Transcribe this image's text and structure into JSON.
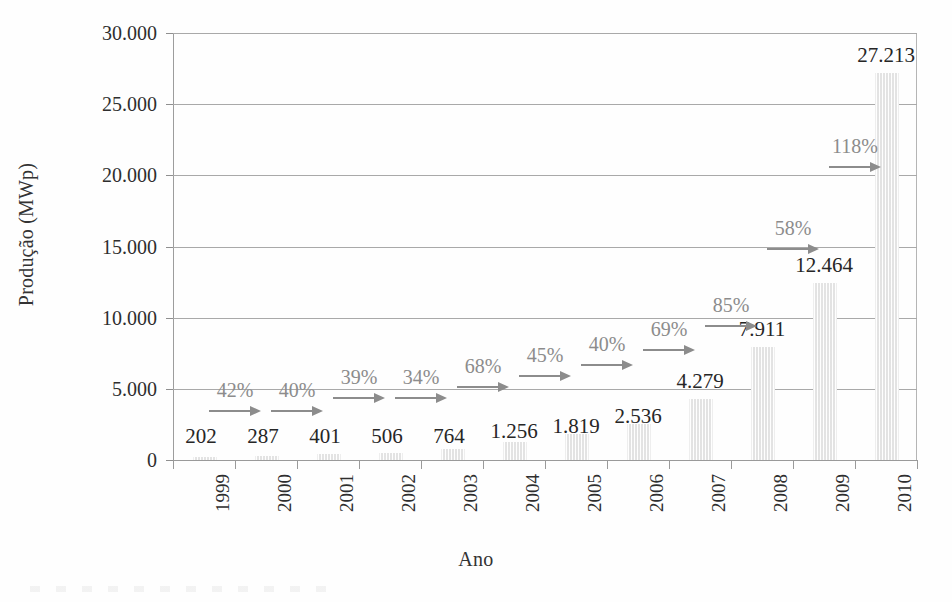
{
  "chart_data": {
    "type": "bar",
    "title": "",
    "xlabel": "Ano",
    "ylabel": "Produção (MWp)",
    "categories": [
      "1999",
      "2000",
      "2001",
      "2002",
      "2003",
      "2004",
      "2005",
      "2006",
      "2007",
      "2008",
      "2009",
      "2010"
    ],
    "values": [
      202,
      287,
      401,
      506,
      764,
      1256,
      1819,
      2536,
      4279,
      7911,
      12464,
      27213
    ],
    "value_labels": [
      "202",
      "287",
      "401",
      "506",
      "764",
      "1.256",
      "1.819",
      "2.536",
      "4.279",
      "7.911",
      "12.464",
      "27.213"
    ],
    "ylim": [
      0,
      30000
    ],
    "ytick_values": [
      0,
      5000,
      10000,
      15000,
      20000,
      25000,
      30000
    ],
    "ytick_labels": [
      "0",
      "5.000",
      "10.000",
      "15.000",
      "20.000",
      "25.000",
      "30.000"
    ],
    "grid": true,
    "legend": "none",
    "annotations": {
      "type": "growth-arrows",
      "labels": [
        "42%",
        "40%",
        "39%",
        "34%",
        "68%",
        "45%",
        "40%",
        "69%",
        "85%",
        "58%",
        "118%"
      ],
      "between": [
        [
          "1999",
          "2000"
        ],
        [
          "2000",
          "2001"
        ],
        [
          "2001",
          "2002"
        ],
        [
          "2002",
          "2003"
        ],
        [
          "2003",
          "2004"
        ],
        [
          "2004",
          "2005"
        ],
        [
          "2005",
          "2006"
        ],
        [
          "2006",
          "2007"
        ],
        [
          "2007",
          "2008"
        ],
        [
          "2008",
          "2009"
        ],
        [
          "2009",
          "2010"
        ]
      ]
    },
    "colors": {
      "bar_fill": "#f3f3f3",
      "grid": "#a9a9a9",
      "annotation": "#8c8c8c",
      "text": "#262626"
    }
  }
}
